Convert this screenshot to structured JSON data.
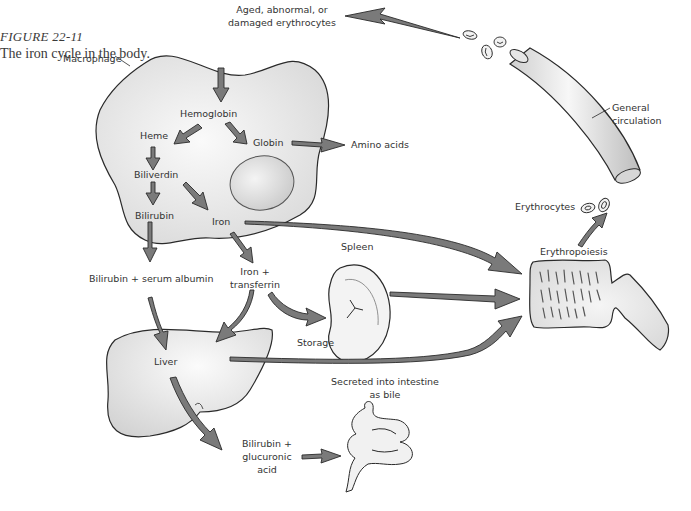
{
  "figure": {
    "number": "FIGURE 22-11",
    "title": "The iron cycle in the body."
  },
  "colors": {
    "arrow_fill": "#7a7a7a",
    "arrow_stroke": "#2a2a2a",
    "organ_fill": "#ececec",
    "outline": "#2a2a2a",
    "text": "#333333"
  },
  "labels": {
    "aged_erythrocytes_line1": "Aged, abnormal, or",
    "aged_erythrocytes_line2": "damaged erythrocytes",
    "macrophage": "Macrophage",
    "hemoglobin": "Hemoglobin",
    "heme": "Heme",
    "globin": "Globin",
    "amino_acids": "Amino acids",
    "biliverdin": "Biliverdin",
    "bilirubin": "Bilirubin",
    "iron": "Iron",
    "bilirubin_albumin": "Bilirubin + serum albumin",
    "iron_transferrin_line1": "Iron +",
    "iron_transferrin_line2": "transferrin",
    "spleen": "Spleen",
    "storage": "Storage",
    "liver": "Liver",
    "secreted_line1": "Secreted into intestine",
    "secreted_line2": "as bile",
    "bilirubin_glucuronic_line1": "Bilirubin +",
    "bilirubin_glucuronic_line2": "glucuronic",
    "bilirubin_glucuronic_line3": "acid",
    "general_circulation_line1": "General",
    "general_circulation_line2": "circulation",
    "erythrocytes": "Erythrocytes",
    "erythropoiesis": "Erythropoiesis"
  },
  "nodes": [
    {
      "id": "macrophage",
      "label": "Macrophage"
    },
    {
      "id": "hemoglobin",
      "label": "Hemoglobin"
    },
    {
      "id": "heme",
      "label": "Heme"
    },
    {
      "id": "globin",
      "label": "Globin"
    },
    {
      "id": "amino_acids",
      "label": "Amino acids"
    },
    {
      "id": "biliverdin",
      "label": "Biliverdin"
    },
    {
      "id": "bilirubin",
      "label": "Bilirubin"
    },
    {
      "id": "iron",
      "label": "Iron"
    },
    {
      "id": "bilirubin_albumin",
      "label": "Bilirubin + serum albumin"
    },
    {
      "id": "iron_transferrin",
      "label": "Iron + transferrin"
    },
    {
      "id": "spleen",
      "label": "Spleen"
    },
    {
      "id": "liver",
      "label": "Liver"
    },
    {
      "id": "bilirubin_glucuronic",
      "label": "Bilirubin + glucuronic acid"
    },
    {
      "id": "intestine",
      "label": "Secreted into intestine as bile"
    },
    {
      "id": "bone_marrow",
      "label": "Erythropoiesis"
    },
    {
      "id": "circulation",
      "label": "General circulation"
    },
    {
      "id": "erythrocytes",
      "label": "Erythrocytes"
    },
    {
      "id": "aged_erythrocytes",
      "label": "Aged, abnormal, or damaged erythrocytes"
    }
  ],
  "edges": [
    {
      "from": "circulation",
      "to": "aged_erythrocytes"
    },
    {
      "from": "aged_erythrocytes",
      "to": "hemoglobin"
    },
    {
      "from": "hemoglobin",
      "to": "heme"
    },
    {
      "from": "hemoglobin",
      "to": "globin"
    },
    {
      "from": "globin",
      "to": "amino_acids"
    },
    {
      "from": "heme",
      "to": "biliverdin"
    },
    {
      "from": "biliverdin",
      "to": "bilirubin"
    },
    {
      "from": "biliverdin",
      "to": "iron"
    },
    {
      "from": "bilirubin",
      "to": "bilirubin_albumin"
    },
    {
      "from": "iron",
      "to": "iron_transferrin"
    },
    {
      "from": "iron",
      "to": "bone_marrow"
    },
    {
      "from": "iron_transferrin",
      "to": "spleen",
      "label": "Storage"
    },
    {
      "from": "iron_transferrin",
      "to": "liver"
    },
    {
      "from": "bilirubin_albumin",
      "to": "liver"
    },
    {
      "from": "spleen",
      "to": "bone_marrow"
    },
    {
      "from": "liver",
      "to": "bone_marrow"
    },
    {
      "from": "liver",
      "to": "bilirubin_glucuronic"
    },
    {
      "from": "bilirubin_glucuronic",
      "to": "intestine"
    },
    {
      "from": "bone_marrow",
      "to": "erythrocytes"
    }
  ]
}
